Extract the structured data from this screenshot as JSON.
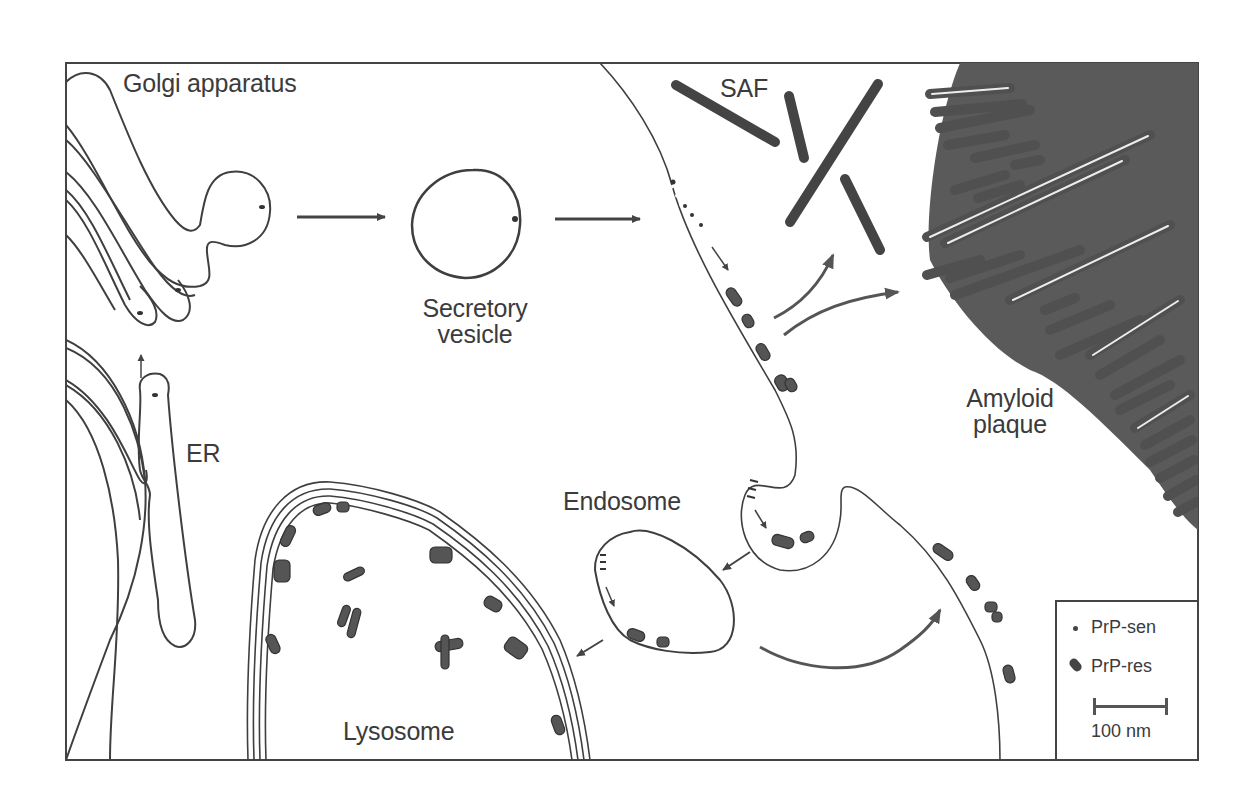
{
  "figure": {
    "type": "cell-biology-schematic",
    "labels": {
      "golgi": "Golgi apparatus",
      "secretory_line1": "Secretory",
      "secretory_line2": "vesicle",
      "saf": "SAF",
      "amyloid_line1": "Amyloid",
      "amyloid_line2": "plaque",
      "er": "ER",
      "endosome": "Endosome",
      "lysosome": "Lysosome"
    },
    "legend": {
      "items": [
        {
          "symbol": "small-dot",
          "label": "PrP-sen"
        },
        {
          "symbol": "dark-oblong",
          "label": "PrP-res"
        }
      ],
      "scale_bar": {
        "label": "100 nm"
      }
    },
    "colors": {
      "line": "#3f3f3f",
      "plaque_fill": "#5a5a5a",
      "prp_res": "#555555",
      "background": "#ffffff"
    }
  }
}
